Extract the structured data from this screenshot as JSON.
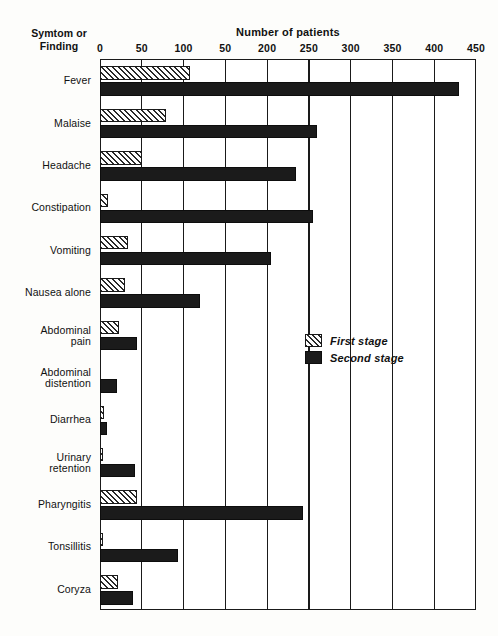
{
  "chart_data": {
    "type": "bar",
    "orientation": "horizontal",
    "title": "Number of patients",
    "xlabel": "Number of patients",
    "ylabel": "Symtom or Finding",
    "ylabel_lines": [
      "Symtom or",
      "Finding"
    ],
    "xlim": [
      0,
      450
    ],
    "xticks": [
      0,
      50,
      100,
      150,
      200,
      250,
      300,
      350,
      400,
      450
    ],
    "xtick_labels": [
      "0",
      "50",
      "100",
      "50",
      "200",
      "250",
      "300",
      "350",
      "400",
      "450"
    ],
    "grid": true,
    "grid_axis": "x",
    "legend_position": "center-right",
    "categories": [
      "Fever",
      "Malaise",
      "Headache",
      "Constipation",
      "Vomiting",
      "Nausea alone",
      "Abdominal pain",
      "Abdominal distention",
      "Diarrhea",
      "Urinary retention",
      "Pharyngitis",
      "Tonsillitis",
      "Coryza"
    ],
    "category_lines": [
      [
        "Fever"
      ],
      [
        "Malaise"
      ],
      [
        "Headache"
      ],
      [
        "Constipation"
      ],
      [
        "Vomiting"
      ],
      [
        "Nausea alone"
      ],
      [
        "Abdominal",
        "pain"
      ],
      [
        "Abdominal",
        "distention"
      ],
      [
        "Diarrhea"
      ],
      [
        "Urinary",
        "retention"
      ],
      [
        "Pharyngitis"
      ],
      [
        "Tonsillitis"
      ],
      [
        "Coryza"
      ]
    ],
    "series": [
      {
        "name": "First stage",
        "fill": "hatched",
        "values": [
          108,
          79,
          50,
          10,
          33,
          30,
          23,
          0,
          5,
          2,
          44,
          4,
          22
        ]
      },
      {
        "name": "Second stage",
        "fill": "solid",
        "values": [
          430,
          260,
          235,
          255,
          205,
          120,
          44,
          20,
          8,
          42,
          243,
          93,
          40
        ]
      }
    ],
    "colors": {
      "second_stage": "#1b1b1b",
      "first_stage_hatch": "#2a2a2a",
      "axis": "#1a1a1a",
      "background": "#ffffff"
    }
  },
  "legend": {
    "items": [
      {
        "label": "First stage"
      },
      {
        "label": "Second stage"
      }
    ]
  }
}
